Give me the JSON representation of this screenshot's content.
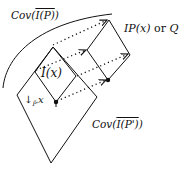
{
  "diagram": {
    "type": "lightcone-covering-diagram",
    "labels": {
      "cov_top_prefix": "Cov(",
      "cov_top_inner": "I(P)",
      "cov_top_suffix": ")",
      "ix": "I(x)",
      "ipx_main": "IP(x)",
      "ipx_or": " or ",
      "ipx_q": "Q",
      "down_arrow": "↓",
      "down_sub": "P̃'",
      "down_x": "x",
      "cov_bot_prefix": "Cov(",
      "cov_bot_inner": "I(P')",
      "cov_bot_suffix": ")"
    },
    "shapes": {
      "large_diamond": {
        "top": [
          53,
          47
        ],
        "right": [
          97,
          97
        ],
        "bottom": [
          51,
          163
        ],
        "left": [
          17,
          95
        ]
      },
      "small_diamond": {
        "top": [
          53,
          47
        ],
        "right": [
          76,
          76
        ],
        "bottom": [
          56,
          102
        ],
        "left": [
          35,
          72
        ]
      },
      "right_diamond": {
        "top": [
          109,
          20
        ],
        "right": [
          130,
          55
        ],
        "bottom": [
          108,
          80
        ],
        "left": [
          87,
          50
        ]
      },
      "arc": {
        "from": [
          3,
          88
        ],
        "to": [
          112,
          14
        ]
      },
      "dotted_arrows": [
        {
          "from": [
            53,
            45
          ],
          "to": [
            107,
            20
          ]
        },
        {
          "from": [
            36,
            70
          ],
          "to": [
            86,
            50
          ]
        },
        {
          "from": [
            77,
            76
          ],
          "to": [
            128,
            54
          ]
        },
        {
          "from": [
            57,
            101
          ],
          "to": [
            106,
            80
          ]
        }
      ],
      "points": [
        [
          56,
          102
        ],
        [
          108,
          80
        ]
      ]
    },
    "colors": {
      "stroke": "#111111",
      "background": "#ffffff"
    }
  }
}
